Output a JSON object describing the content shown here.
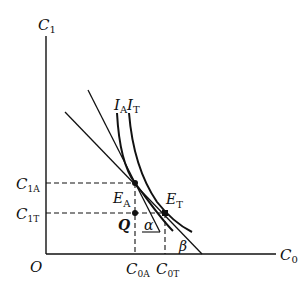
{
  "diagram": {
    "axes": {
      "y_label": "C",
      "y_sub": "1",
      "x_label": "C",
      "x_sub": "0",
      "origin": "O"
    },
    "curves": {
      "ia_label": "I",
      "ia_sub": "A",
      "it_label": "I",
      "it_sub": "T"
    },
    "points": {
      "ea_label": "E",
      "ea_sub": "A",
      "et_label": "E",
      "et_sub": "T",
      "q_label": "Q"
    },
    "ticks": {
      "c1a_label": "C",
      "c1a_sub": "1A",
      "c1t_label": "C",
      "c1t_sub": "1T",
      "c0a_label": "C",
      "c0a_sub": "0A",
      "c0t_label": "C",
      "c0t_sub": "0T"
    },
    "angles": {
      "alpha": "α",
      "beta": "β"
    },
    "colors": {
      "ink": "#111111",
      "background": "#ffffff"
    }
  }
}
